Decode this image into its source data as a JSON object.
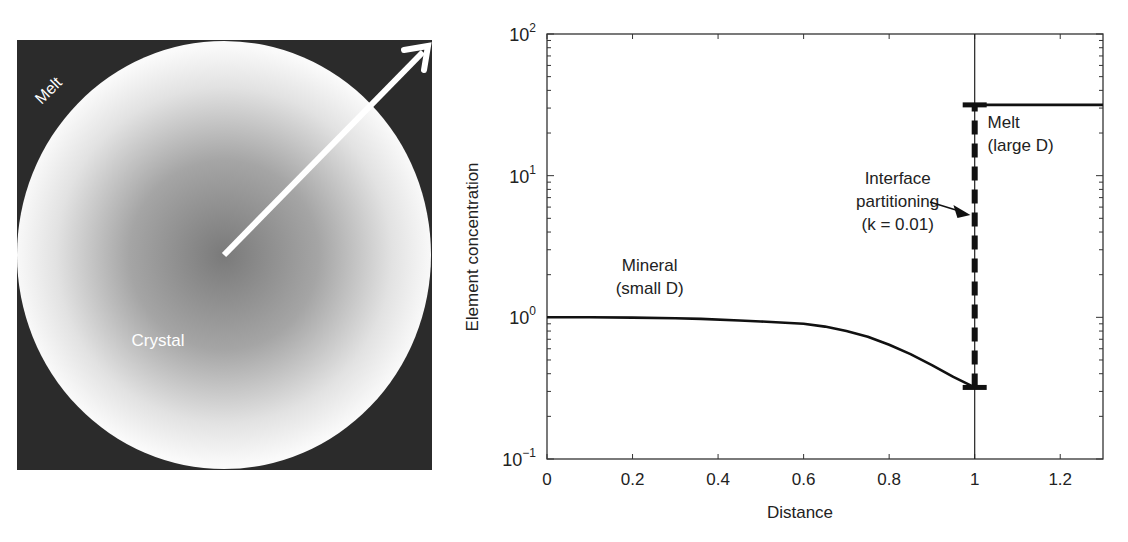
{
  "left_panel": {
    "melt_label": "Melt",
    "crystal_label": "Crystal",
    "colors": {
      "melt": "#2b2b2b",
      "crystal_center": "#7a7a7a",
      "crystal_edge": "#fafafa",
      "arrow": "#ffffff",
      "label": "#ffffff"
    }
  },
  "chart_data": {
    "type": "line",
    "title": "",
    "xlabel": "Distance",
    "ylabel": "Element concentration",
    "xlim": [
      0,
      1.3
    ],
    "ylim": [
      0.1,
      100
    ],
    "yscale": "log",
    "grid": false,
    "x_ticks": [
      0,
      0.2,
      0.4,
      0.6,
      0.8,
      1,
      1.2
    ],
    "x_tick_labels": [
      "0",
      "0.2",
      "0.4",
      "0.6",
      "0.8",
      "1",
      "1.2"
    ],
    "y_ticks": [
      0.1,
      1,
      10,
      100
    ],
    "y_tick_labels": [
      {
        "base": "10",
        "exp": "−1"
      },
      {
        "base": "10",
        "exp": "0"
      },
      {
        "base": "10",
        "exp": "1"
      },
      {
        "base": "10",
        "exp": "2"
      }
    ],
    "series": [
      {
        "name": "Mineral (small D)",
        "style": "solid",
        "x": [
          0,
          0.1,
          0.2,
          0.3,
          0.36,
          0.45,
          0.5,
          0.6,
          0.65,
          0.7,
          0.75,
          0.8,
          0.85,
          0.9,
          0.95,
          1.0
        ],
        "y": [
          1.0,
          1.0,
          0.995,
          0.985,
          0.975,
          0.95,
          0.935,
          0.9,
          0.86,
          0.8,
          0.73,
          0.64,
          0.55,
          0.46,
          0.38,
          0.32
        ]
      },
      {
        "name": "Melt (large D)",
        "style": "solid",
        "x": [
          1.0,
          1.3
        ],
        "y": [
          31.6,
          31.6
        ]
      },
      {
        "name": "Interface partitioning (k = 0.01)",
        "style": "dashed",
        "x": [
          1.0,
          1.0
        ],
        "y": [
          0.32,
          31.6
        ]
      }
    ],
    "interface_line_x": 1.0,
    "annotations": [
      {
        "id": "mineral",
        "lines": [
          "Mineral",
          "(small D)"
        ],
        "x": 0.24,
        "y": 1.8
      },
      {
        "id": "melt",
        "lines": [
          "Melt",
          "(large D)"
        ],
        "x": 1.14,
        "y": 18
      },
      {
        "id": "interface",
        "lines": [
          "Interface",
          "partitioning",
          "(k = 0.01)"
        ],
        "x": 0.82,
        "y": 6.5,
        "arrow_to": {
          "x": 0.99,
          "y": 5.2
        }
      }
    ]
  }
}
